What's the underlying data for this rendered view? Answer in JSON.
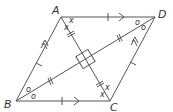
{
  "figure": {
    "type": "rhombus-diagram",
    "vertices": {
      "A": {
        "label": "A",
        "x": 61,
        "y": 17
      },
      "D": {
        "label": "D",
        "x": 155,
        "y": 17
      },
      "B": {
        "label": "B",
        "x": 16,
        "y": 101
      },
      "C": {
        "label": "C",
        "x": 110,
        "y": 101
      }
    },
    "angle_marks": {
      "A": [
        "x",
        "x"
      ],
      "C": [
        "x",
        "x"
      ],
      "B": [
        "o",
        "o"
      ],
      "D": [
        "o",
        "o"
      ]
    },
    "stroke_color": "#555555",
    "right_angle_at_center": true
  }
}
